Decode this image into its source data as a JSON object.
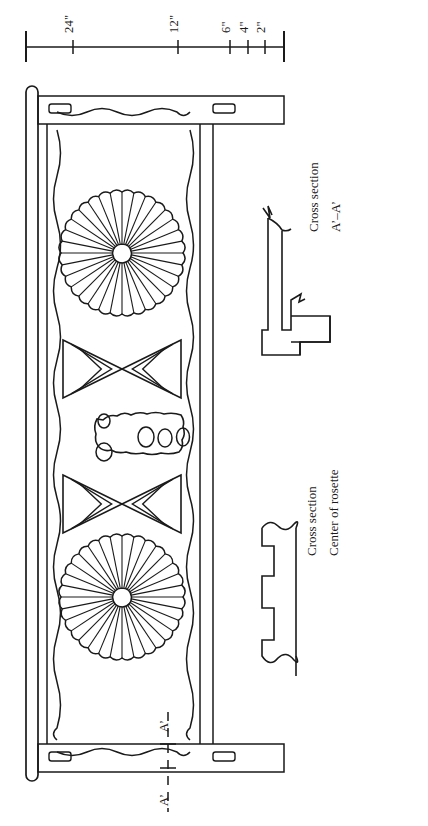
{
  "document": {
    "type": "measured-architectural-drawing",
    "subject": "Carved decorative panel with rosettes",
    "orientation": "plan rotated 90 degrees",
    "background_color": "#ffffff",
    "ink_color": "#1a1a1a"
  },
  "scale_bar": {
    "name": "graphic-scale",
    "orientation": "horizontal-bar-with-rotated-labels",
    "unit": "inches",
    "zero_at": "right",
    "ticks": [
      {
        "label": "24\"",
        "value": 24,
        "x": 73
      },
      {
        "label": "12\"",
        "value": 12,
        "x": 178
      },
      {
        "label": "6\"",
        "value": 6,
        "x": 230
      },
      {
        "label": "4\"",
        "value": 4,
        "x": 248
      },
      {
        "label": "2\"",
        "value": 2,
        "x": 265
      }
    ],
    "end_caps": [
      {
        "name": "left-end-cap",
        "x": 26
      },
      {
        "name": "right-end-cap",
        "x": 283
      }
    ]
  },
  "panel": {
    "name": "carved-panel-elevation",
    "description": "Rectangular framed panel with scalloped inner border, two rosettes, two bowtie motifs and one central organic motif",
    "rails": [
      {
        "name": "top-rail",
        "mortises": 2
      },
      {
        "name": "bottom-rail",
        "mortises": 2
      }
    ],
    "mortise_count": 4,
    "scallop_border": "wavy-line-inner-edge",
    "motifs": [
      {
        "name": "rosette-upper",
        "type": "rosette",
        "petals": 32,
        "cx": 122,
        "cy": 253,
        "r": 61
      },
      {
        "name": "bowtie-upper",
        "type": "bowtie",
        "cx": 122,
        "cy": 369
      },
      {
        "name": "center-motif",
        "type": "organic-blob",
        "cx": 140,
        "cy": 437,
        "inner_ovals": 3
      },
      {
        "name": "bowtie-lower",
        "type": "bowtie",
        "cx": 122,
        "cy": 504
      },
      {
        "name": "rosette-lower",
        "type": "rosette",
        "petals": 32,
        "cx": 122,
        "cy": 597,
        "r": 61
      }
    ]
  },
  "section_marks": {
    "name": "section-line-a",
    "line_style": "dashed",
    "labels": [
      {
        "name": "section-label-a-upper",
        "text": "A’",
        "x": 168,
        "y": 732
      },
      {
        "name": "section-label-a-lower",
        "text": "A’",
        "x": 168,
        "y": 800
      }
    ]
  },
  "details": [
    {
      "name": "cross-section-aa",
      "title_line_1": "Cross section",
      "title_line_2": "A’–A’",
      "profile": "stepped-tenon-and-shoulder-profile"
    },
    {
      "name": "cross-section-rosette",
      "title_line_1": "Cross section",
      "title_line_2": "Center of rosette",
      "profile": "undulating-carved-relief-profile"
    }
  ]
}
